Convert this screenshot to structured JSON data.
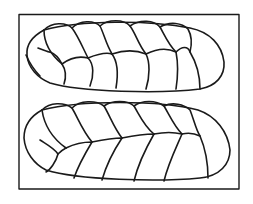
{
  "figure": {
    "caption": "",
    "stroke_color": "#1a1a1a",
    "background_color": "#ffffff",
    "loaves": [
      {
        "name": "top-loaf",
        "strand_segments": 13
      },
      {
        "name": "bottom-loaf",
        "strand_segments": 13
      }
    ]
  }
}
